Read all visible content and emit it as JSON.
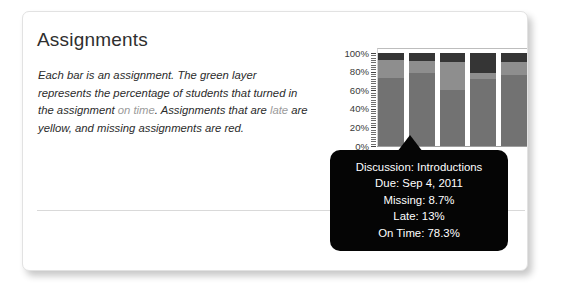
{
  "card": {
    "title": "Assignments",
    "description": {
      "part1": "Each bar is an assignment. The green layer represents the percentage of students that turned in the assignment ",
      "ontime": "on time",
      "part2": ". Assignments that are ",
      "late": "late",
      "part3": " are yellow, and ",
      "missing": "missing",
      "part4": " assignments are red."
    }
  },
  "chart_data": {
    "type": "bar",
    "subtype": "stacked-percentage",
    "title": "",
    "xlabel": "",
    "ylabel": "",
    "ylim": [
      0,
      100
    ],
    "grid": false,
    "legend_position": "none",
    "ytick_labels": [
      "100%",
      "80%",
      "60%",
      "40%",
      "20%",
      "0%"
    ],
    "ytick_values": [
      100,
      80,
      60,
      40,
      20,
      0
    ],
    "categories": [
      "1",
      "2",
      "3",
      "4",
      "5"
    ],
    "series": [
      {
        "name": "On Time",
        "color": "#727272",
        "values": [
          73,
          78.3,
          60,
          72,
          76
        ]
      },
      {
        "name": "Late",
        "color": "#8e8e8e",
        "values": [
          19,
          13,
          30,
          7,
          14
        ]
      },
      {
        "name": "Missing",
        "color": "#353535",
        "values": [
          8,
          8.7,
          10,
          21,
          10
        ]
      }
    ],
    "highlighted_index": 1
  },
  "tooltip": {
    "name": "Discussion: Introductions",
    "due": "Due: Sep 4, 2011",
    "missing": "Missing: 8.7%",
    "late": "Late: 13%",
    "ontime": "On Time: 78.3%"
  }
}
